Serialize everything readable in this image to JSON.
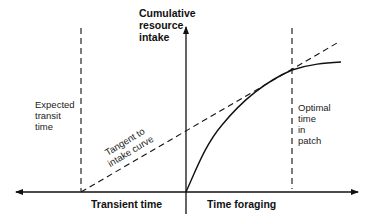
{
  "diagram": {
    "y_axis_label": [
      "Cumulative",
      "resource",
      "intake"
    ],
    "x_axis_left_label": "Transient time",
    "x_axis_right_label": "Time foraging",
    "left_marker_label": [
      "Expected",
      "transit",
      "time"
    ],
    "right_marker_label": [
      "Optimal",
      "time",
      "in",
      "patch"
    ],
    "tangent_label": [
      "Tangent to",
      "intake curve"
    ],
    "colors": {
      "line": "#111111",
      "background": "#ffffff"
    }
  }
}
